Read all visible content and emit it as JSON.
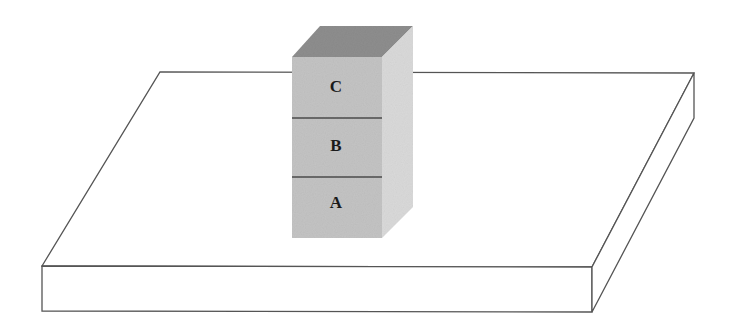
{
  "diagram": {
    "blocks": [
      {
        "label": "C",
        "position": "top"
      },
      {
        "label": "B",
        "position": "middle"
      },
      {
        "label": "A",
        "position": "bottom"
      }
    ],
    "colors": {
      "front_face": "#c4c4c4",
      "top_face": "#8e8e8e",
      "side_face": "#dadada",
      "outline": "#555555",
      "divider": "#4a4a4a"
    }
  }
}
